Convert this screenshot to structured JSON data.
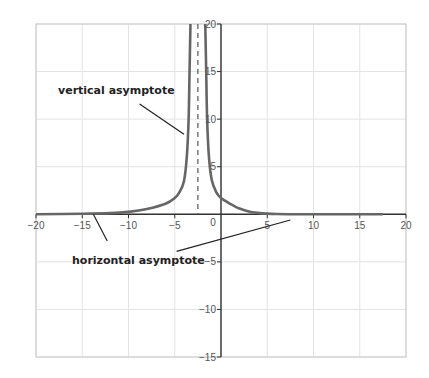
{
  "chart_data": {
    "type": "line",
    "title": "",
    "xlabel": "",
    "ylabel": "",
    "xlim": [
      -20,
      20
    ],
    "ylim": [
      -15,
      20
    ],
    "grid": true,
    "x_ticks": [
      -20,
      -15,
      -10,
      -5,
      0,
      5,
      10,
      15,
      20
    ],
    "x_tick_labels": [
      "−20",
      "−15",
      "−10",
      "−5",
      "0",
      "5",
      "10",
      "15",
      "20"
    ],
    "y_ticks": [
      20,
      15,
      10,
      5,
      -5,
      -10,
      -15
    ],
    "y_tick_labels": [
      "20",
      "15",
      "10",
      "5",
      "−5",
      "−10",
      "−15"
    ],
    "series": [
      {
        "name": "f(x)",
        "color": "#666666",
        "left_branch": {
          "x": [
            -20,
            -15,
            -12,
            -10,
            -8,
            -6,
            -5,
            -4.5,
            -4,
            -3.7,
            -3.5,
            -3.4,
            -3.3
          ],
          "y": [
            0.0,
            0.05,
            0.12,
            0.25,
            0.55,
            1.1,
            1.7,
            2.3,
            3.5,
            6.0,
            10.0,
            15.0,
            20.0
          ]
        },
        "right_branch": {
          "x": [
            -1.7,
            -1.6,
            -1.5,
            -1.3,
            -1.0,
            -0.5,
            0,
            1,
            2,
            3,
            4,
            5,
            6,
            8,
            10,
            17.5
          ],
          "y": [
            20.0,
            15.0,
            10.0,
            6.0,
            3.6,
            2.3,
            1.7,
            1.1,
            0.6,
            0.3,
            0.15,
            0.07,
            0.03,
            0.0,
            0.0,
            0.0
          ]
        }
      }
    ],
    "asymptotes": {
      "vertical": {
        "x": -2.5,
        "style": "dashed"
      },
      "horizontal": {
        "y": 0
      }
    },
    "annotations": [
      {
        "text": "vertical asymptote",
        "pointer_from": [
          -8.8,
          11.6
        ],
        "pointer_to": [
          -4.0,
          8.4
        ]
      },
      {
        "text": "horizontal asymptote",
        "pointer_from": [
          -12.3,
          -2.8
        ],
        "pointer_to": [
          -13.8,
          0.0
        ]
      },
      {
        "text": "horizontal asymptote",
        "pointer_from": [
          -4.8,
          -3.9
        ],
        "pointer_to": [
          7.5,
          -0.6
        ]
      }
    ]
  },
  "labels": {
    "vertical": "vertical asymptote",
    "horizontal": "horizontal asymptote"
  }
}
